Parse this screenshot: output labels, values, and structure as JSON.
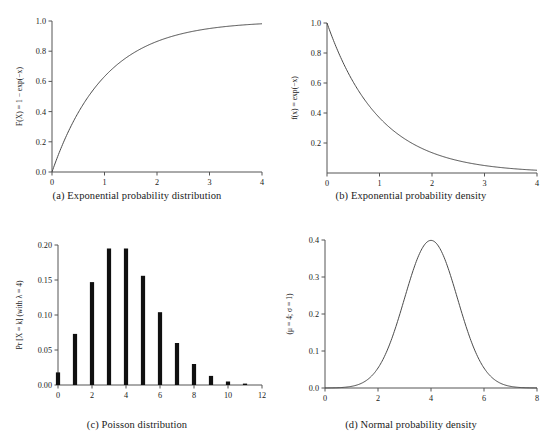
{
  "figure": {
    "background": "#ffffff",
    "curve_color": "#4a4a4a",
    "bar_color": "#101010",
    "axis_color": "#555555"
  },
  "panels": {
    "a": {
      "caption": "(a) Exponential probability distribution",
      "ylabel": "F(X) = 1 − exp(−x)",
      "xticks": [
        "0",
        "1",
        "2",
        "3",
        "4"
      ],
      "yticks": [
        "0.0",
        "0.2",
        "0.4",
        "0.6",
        "0.8",
        "1.0"
      ]
    },
    "b": {
      "caption": "(b) Exponential probability density",
      "ylabel": "f(x) = exp(−x)",
      "xticks": [
        "0",
        "1",
        "2",
        "3",
        "4"
      ],
      "yticks": [
        "0.2",
        "0.4",
        "0.6",
        "0.8",
        "1.0"
      ]
    },
    "c": {
      "caption": "(c) Poisson distribution",
      "ylabel": "Pr [X = k] (with λ = 4)",
      "xticks": [
        "0",
        "2",
        "4",
        "6",
        "8",
        "10",
        "12"
      ],
      "yticks": [
        "0.00",
        "0.05",
        "0.10",
        "0.15",
        "0.20"
      ]
    },
    "d": {
      "caption": "(d) Normal probability density",
      "ylabel": "(μ = 4; σ = 1)",
      "xticks": [
        "0",
        "2",
        "4",
        "6",
        "8"
      ],
      "yticks": [
        "0.0",
        "0.1",
        "0.2",
        "0.3",
        "0.4"
      ]
    }
  },
  "chart_data": [
    {
      "id": "a",
      "type": "line",
      "title": "(a) Exponential probability distribution",
      "xlabel": "",
      "ylabel": "F(X) = 1 − exp(−x)",
      "xlim": [
        0,
        4
      ],
      "ylim": [
        0,
        1
      ],
      "xticks": [
        0,
        1,
        2,
        3,
        4
      ],
      "yticks": [
        0.0,
        0.2,
        0.4,
        0.6,
        0.8,
        1.0
      ],
      "grid": false,
      "legend": null,
      "function": "F(x) = 1 - exp(-x)",
      "x": [
        0,
        0.2,
        0.4,
        0.6,
        0.8,
        1.0,
        1.2,
        1.4,
        1.6,
        1.8,
        2.0,
        2.2,
        2.4,
        2.6,
        2.8,
        3.0,
        3.2,
        3.4,
        3.6,
        3.8,
        4.0
      ],
      "y": [
        0.0,
        0.181,
        0.33,
        0.451,
        0.551,
        0.632,
        0.699,
        0.753,
        0.798,
        0.835,
        0.865,
        0.889,
        0.909,
        0.926,
        0.939,
        0.95,
        0.959,
        0.967,
        0.973,
        0.978,
        0.982
      ]
    },
    {
      "id": "b",
      "type": "line",
      "title": "(b) Exponential probability density",
      "xlabel": "",
      "ylabel": "f(x) = exp(−x)",
      "xlim": [
        0,
        4
      ],
      "ylim": [
        0,
        1
      ],
      "xticks": [
        0,
        1,
        2,
        3,
        4
      ],
      "yticks": [
        0.2,
        0.4,
        0.6,
        0.8,
        1.0
      ],
      "grid": false,
      "legend": null,
      "function": "f(x) = exp(-x)",
      "x": [
        0,
        0.2,
        0.4,
        0.6,
        0.8,
        1.0,
        1.2,
        1.4,
        1.6,
        1.8,
        2.0,
        2.2,
        2.4,
        2.6,
        2.8,
        3.0,
        3.2,
        3.4,
        3.6,
        3.8,
        4.0
      ],
      "y": [
        1.0,
        0.819,
        0.67,
        0.549,
        0.449,
        0.368,
        0.301,
        0.247,
        0.202,
        0.165,
        0.135,
        0.111,
        0.091,
        0.074,
        0.061,
        0.05,
        0.041,
        0.033,
        0.027,
        0.022,
        0.018
      ]
    },
    {
      "id": "c",
      "type": "bar",
      "title": "(c) Poisson distribution",
      "xlabel": "",
      "ylabel": "Pr [X = k] (with λ = 4)",
      "xlim": [
        0,
        12
      ],
      "ylim": [
        0,
        0.2
      ],
      "xticks": [
        0,
        2,
        4,
        6,
        8,
        10,
        12
      ],
      "yticks": [
        0.0,
        0.05,
        0.1,
        0.15,
        0.2
      ],
      "grid": false,
      "legend": null,
      "lambda": 4,
      "categories": [
        0,
        1,
        2,
        3,
        4,
        5,
        6,
        7,
        8,
        9,
        10,
        11
      ],
      "values": [
        0.018,
        0.073,
        0.147,
        0.195,
        0.195,
        0.156,
        0.104,
        0.06,
        0.03,
        0.013,
        0.005,
        0.002
      ]
    },
    {
      "id": "d",
      "type": "line",
      "title": "(d) Normal probability density",
      "xlabel": "",
      "ylabel": "(μ = 4; σ = 1)",
      "xlim": [
        0,
        8
      ],
      "ylim": [
        0,
        0.4
      ],
      "xticks": [
        0,
        2,
        4,
        6,
        8
      ],
      "yticks": [
        0.0,
        0.1,
        0.2,
        0.3,
        0.4
      ],
      "grid": false,
      "legend": null,
      "mu": 4,
      "sigma": 1,
      "function": "f(x) = exp(-(x-4)^2/2)/sqrt(2*pi)",
      "x": [
        0,
        0.5,
        1.0,
        1.5,
        2.0,
        2.5,
        3.0,
        3.5,
        4.0,
        4.5,
        5.0,
        5.5,
        6.0,
        6.5,
        7.0,
        7.5,
        8.0
      ],
      "y": [
        0.0001,
        0.0009,
        0.0044,
        0.0175,
        0.054,
        0.1295,
        0.242,
        0.3521,
        0.3989,
        0.3521,
        0.242,
        0.1295,
        0.054,
        0.0175,
        0.0044,
        0.0009,
        0.0001
      ]
    }
  ]
}
